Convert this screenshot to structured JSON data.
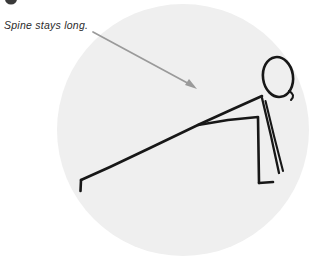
{
  "figure": {
    "kind": "line-drawing-illustration",
    "canvas": {
      "width": 323,
      "height": 262
    },
    "background_color": "#ffffff"
  },
  "backdrop": {
    "name": "circle-backdrop",
    "shape": "circle",
    "fill_color": "#efefef",
    "center_x": 183,
    "center_y": 130,
    "radius": 126
  },
  "annotation": {
    "label": "Spine stays long.",
    "text_color": "#2b2b2b",
    "style": "italic"
  },
  "pointer": {
    "name": "annotation-arrow",
    "color": "#9a9a9a",
    "from_x": 93,
    "from_y": 32,
    "to_x": 197,
    "to_y": 89,
    "head_size": 9
  },
  "drawing": {
    "ink_color": "#171717",
    "stroke_width": 2.6,
    "parts": {
      "head": {
        "name": "head-oval",
        "center_x": 278,
        "center_y": 77,
        "radius_x": 15,
        "radius_y": 20,
        "rotation_deg": -8
      },
      "head_tail": {
        "name": "head-tail-curl",
        "path": "M 289 92 Q 295 96 291 100"
      },
      "spine": {
        "name": "spine-line",
        "path": "M 262 96 L 200 124 L 81 180"
      },
      "hand_hook": {
        "name": "hand-hook",
        "path": "M 81 180 L 81 191"
      },
      "arm": {
        "name": "arm-line",
        "path": "M 198 125 L 258 117 L 259 183"
      },
      "front_foot": {
        "name": "front-foot",
        "path": "M 259 183 L 273 182"
      },
      "back_leg_a": {
        "name": "back-leg-front",
        "path": "M 262 98 L 279 173"
      },
      "back_leg_b": {
        "name": "back-leg-back",
        "path": "M 265 100 L 283 171"
      }
    }
  },
  "corner_mark": {
    "name": "cropped-step-badge",
    "color": "#3a3a3a",
    "x": 5,
    "y": -6,
    "width": 12,
    "height": 11
  }
}
